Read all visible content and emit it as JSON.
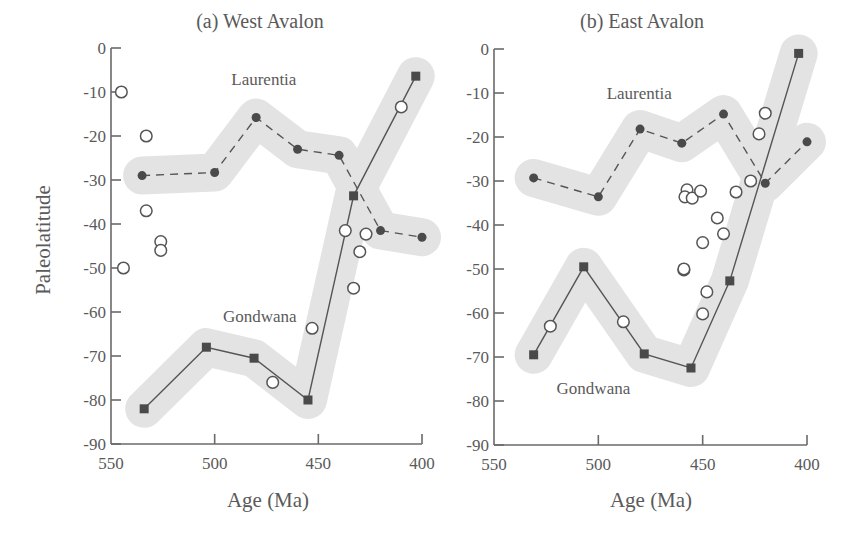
{
  "figure": {
    "ylabel": "Paleolatitude",
    "band_color": "#e3e3e3",
    "line_color": "#555555",
    "marker_color": "#4a4a4a"
  },
  "chart_data": [
    {
      "type": "line",
      "title": "(a) West Avalon",
      "xlabel": "Age (Ma)",
      "ylabel": "Paleolatitude",
      "xlim": [
        550,
        400
      ],
      "ylim": [
        -90,
        0
      ],
      "x_ticks": [
        550,
        500,
        450,
        400
      ],
      "y_ticks": [
        0,
        -10,
        -20,
        -30,
        -40,
        -50,
        -60,
        -70,
        -80,
        -90
      ],
      "x_tick_labels": [
        "550",
        "500",
        "450",
        "400"
      ],
      "y_tick_labels": [
        "0",
        "-10",
        "-20",
        "-30",
        "-40",
        "-50",
        "-60",
        "-70",
        "-80",
        "-90"
      ],
      "grid": false,
      "annotations": [
        {
          "text": "Laurentia",
          "x": 492,
          "y": -7
        },
        {
          "text": "Gondwana",
          "x": 496,
          "y": -61
        }
      ],
      "series": [
        {
          "name": "Laurentia",
          "style": "dashed",
          "marker": "circle-filled",
          "shaded_band": true,
          "x": [
            535,
            500,
            480,
            460,
            440,
            420,
            400
          ],
          "y": [
            -29,
            -28.3,
            -15.8,
            -23,
            -24.4,
            -41.5,
            -43
          ]
        },
        {
          "name": "Gondwana",
          "style": "solid",
          "marker": "square-filled",
          "shaded_band": true,
          "x": [
            534,
            504,
            481,
            455,
            433,
            403
          ],
          "y": [
            -82,
            -68,
            -70.5,
            -80,
            -33.6,
            -6.4
          ]
        },
        {
          "name": "Avalon observations",
          "style": "none",
          "marker": "circle-open",
          "x": [
            545,
            533,
            533,
            526,
            526,
            544,
            472,
            453,
            437,
            427,
            430,
            433,
            410
          ],
          "y": [
            -10,
            -20,
            -37,
            -44,
            -46,
            -50,
            -76,
            -63.7,
            -41.5,
            -42.3,
            -46.3,
            -54.6,
            -13.4
          ]
        }
      ]
    },
    {
      "type": "line",
      "title": "(b) East Avalon",
      "xlabel": "Age (Ma)",
      "ylabel": "",
      "xlim": [
        550,
        400
      ],
      "ylim": [
        -90,
        0
      ],
      "x_ticks": [
        550,
        500,
        450,
        400
      ],
      "y_ticks": [
        0,
        -10,
        -20,
        -30,
        -40,
        -50,
        -60,
        -70,
        -80,
        -90
      ],
      "x_tick_labels": [
        "550",
        "500",
        "450",
        "400"
      ],
      "y_tick_labels": [
        "0",
        "-10",
        "-20",
        "-30",
        "-40",
        "-50",
        "-60",
        "-70",
        "-80",
        "-90"
      ],
      "grid": false,
      "annotations": [
        {
          "text": "Laurentia",
          "x": 496,
          "y": -10
        },
        {
          "text": "Gondwana",
          "x": 520,
          "y": -77
        }
      ],
      "series": [
        {
          "name": "Laurentia",
          "style": "dashed",
          "marker": "circle-filled",
          "shaded_band": true,
          "x": [
            531,
            500,
            480,
            460,
            440,
            420,
            400
          ],
          "y": [
            -29.3,
            -33.6,
            -18.2,
            -21.4,
            -14.8,
            -30.5,
            -21.1
          ]
        },
        {
          "name": "Gondwana",
          "style": "solid",
          "marker": "square-filled",
          "shaded_band": true,
          "x": [
            531,
            507,
            478,
            455.6,
            437,
            404
          ],
          "y": [
            -69.5,
            -49.5,
            -69.3,
            -72.5,
            -52.7,
            -1
          ]
        },
        {
          "name": "Avalon observations",
          "style": "none",
          "marker": "circle-open",
          "x": [
            523,
            488,
            459,
            448,
            450,
            450,
            459,
            443,
            440,
            457.5,
            458.5,
            455,
            451,
            434,
            427,
            423,
            420
          ],
          "y": [
            -63,
            -62,
            -50.2,
            -55.2,
            -60.2,
            -44,
            -50,
            -38.4,
            -42,
            -32,
            -33.6,
            -33.9,
            -32.3,
            -32.5,
            -30,
            -19.3,
            -14.6
          ]
        }
      ]
    }
  ]
}
